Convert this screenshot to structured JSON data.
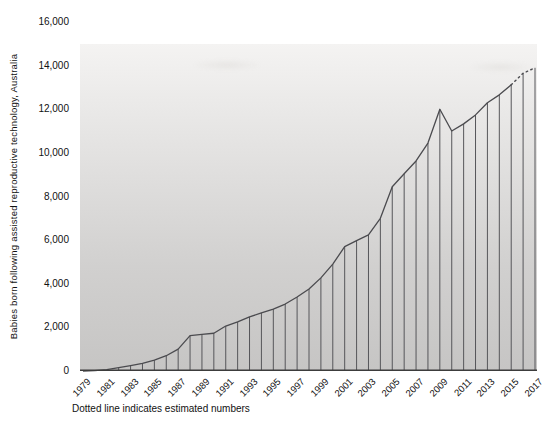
{
  "chart_data": {
    "type": "area",
    "title": "",
    "ylabel": "Babies born following assisted reproductive technology, Australia",
    "xlabel": "",
    "note": "Dotted line indicates estimated numbers",
    "x": [
      1979,
      1980,
      1981,
      1982,
      1983,
      1984,
      1985,
      1986,
      1987,
      1988,
      1989,
      1990,
      1991,
      1992,
      1993,
      1994,
      1995,
      1996,
      1997,
      1998,
      1999,
      2000,
      2001,
      2002,
      2003,
      2004,
      2005,
      2006,
      2007,
      2008,
      2009,
      2010,
      2011,
      2012,
      2013,
      2014,
      2015,
      2016,
      2017
    ],
    "values": [
      0,
      20,
      60,
      150,
      250,
      350,
      500,
      700,
      1000,
      1620,
      1680,
      1730,
      2060,
      2250,
      2480,
      2660,
      2840,
      3070,
      3390,
      3760,
      4270,
      4900,
      5700,
      5980,
      6240,
      7000,
      8450,
      9040,
      9630,
      10450,
      12000,
      11000,
      11330,
      11740,
      12300,
      12660,
      13120,
      13650,
      13900
    ],
    "xtick_labels": [
      "1979",
      "1981",
      "1983",
      "1985",
      "1987",
      "1989",
      "1991",
      "1993",
      "1995",
      "1997",
      "1999",
      "2001",
      "2003",
      "2005",
      "2007",
      "2009",
      "2011",
      "2013",
      "2015",
      "2017"
    ],
    "ytick_values": [
      0,
      2000,
      4000,
      6000,
      8000,
      10000,
      12000,
      14000,
      16000
    ],
    "ylim": [
      0,
      16000
    ],
    "grid": false,
    "legend": "none",
    "dotted_from_year": 2015,
    "estimated_years": [
      2016,
      2017
    ],
    "colors": {
      "line": "#4b4b4f",
      "stems": "#56565a",
      "axis": "#3c3c3c",
      "text": "#111111",
      "plot_bg_top": "#f4f3f2",
      "plot_bg_bottom": "#c6c5c4"
    }
  }
}
